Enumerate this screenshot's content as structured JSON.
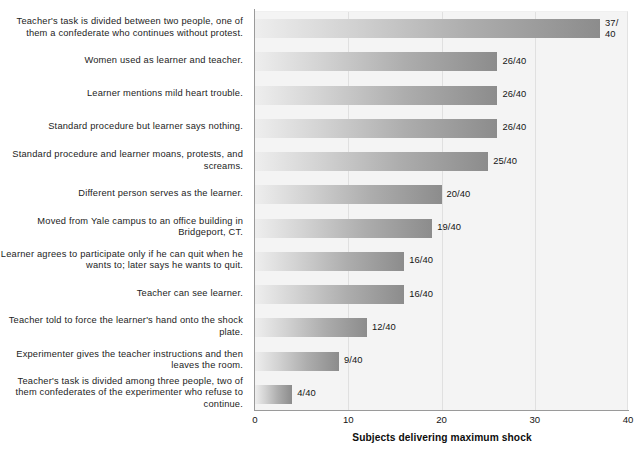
{
  "chart_data": {
    "type": "bar",
    "orientation": "horizontal",
    "title": "",
    "xlabel": "Subjects delivering maximum shock",
    "ylabel": "",
    "xlim": [
      0,
      40
    ],
    "xticks": [
      0,
      10,
      20,
      30,
      40
    ],
    "grid": true,
    "legend": null,
    "total": 40,
    "categories": [
      "Teacher's task is divided between two people, one of them a confederate who continues without protest.",
      "Women used as learner and teacher.",
      "Learner mentions mild heart trouble.",
      "Standard procedure but learner says nothing.",
      "Standard procedure and learner moans, protests, and screams.",
      "Different person serves as the learner.",
      "Moved from Yale campus to an office building in Bridgeport, CT.",
      "Learner agrees to participate only if he can quit when he wants to; later says he wants to quit.",
      "Teacher can see learner.",
      "Teacher told to force the learner's hand onto the shock plate.",
      "Experimenter gives the teacher instructions and then leaves the room.",
      "Teacher's task is divided among three people, two of them confederates of the experimenter who refuse to continue."
    ],
    "values": [
      37,
      26,
      26,
      26,
      25,
      20,
      19,
      16,
      16,
      12,
      9,
      4
    ],
    "value_labels": [
      "37/\n40",
      "26/40",
      "26/40",
      "26/40",
      "25/40",
      "20/40",
      "19/40",
      "16/40",
      "16/40",
      "12/40",
      "9/40",
      "4/40"
    ],
    "tick_labels": [
      "0",
      "10",
      "20",
      "30",
      "40"
    ],
    "colors": {
      "bar_gradient_start": "#eeeeee",
      "bar_gradient_end": "#8c8c8c",
      "plot_background": "#f4f4f4",
      "gridline": "#e0e0e0",
      "axis_line": "#9a9a9a",
      "text": "#141414"
    }
  }
}
